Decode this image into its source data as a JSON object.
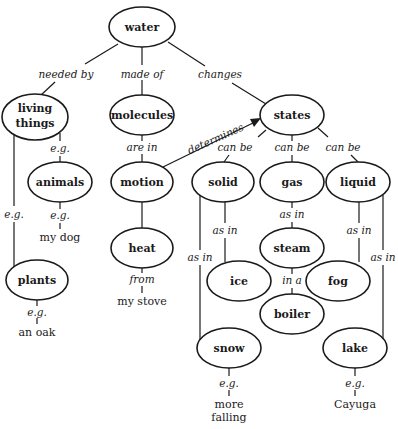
{
  "nodes": {
    "water": "water",
    "living_things_1": "living",
    "living_things_2": "things",
    "molecules": "molecules",
    "states": "states",
    "animals": "animals",
    "motion": "motion",
    "solid": "solid",
    "gas": "gas",
    "liquid": "liquid",
    "heat": "heat",
    "steam": "steam",
    "plants": "plants",
    "ice": "ice",
    "fog": "fog",
    "boiler": "boiler",
    "snow": "snow",
    "lake": "lake"
  },
  "links": {
    "needed_by": "needed by",
    "made_of": "made of",
    "changes": "changes",
    "are_in": "are in",
    "determines": "determines",
    "eg_animals": "e.g.",
    "eg_plants": "e.g.",
    "eg_dog": "e.g.",
    "can_be_solid": "can be",
    "can_be_gas": "can be",
    "can_be_liquid": "can be",
    "as_in_ice": "as in",
    "as_in_snow": "as in",
    "as_in_steam": "as in",
    "as_in_fog": "as in",
    "as_in_lake": "as in",
    "in_a": "in a",
    "from": "from",
    "eg_oak": "e.g.",
    "eg_snow": "e.g.",
    "eg_lake": "e.g."
  },
  "examples": {
    "my_dog": "my dog",
    "my_stove": "my stove",
    "an_oak": "an oak",
    "more": "more",
    "falling": "falling",
    "cayuga": "Cayuga"
  }
}
